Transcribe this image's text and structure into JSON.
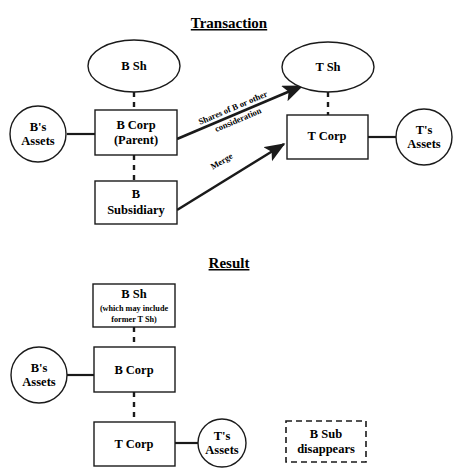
{
  "figure": {
    "background_color": "#ffffff",
    "stroke_color": "#1a1a1a"
  },
  "sections": [
    {
      "id": "transaction",
      "heading": "Transaction"
    },
    {
      "id": "result",
      "heading": "Result"
    }
  ],
  "transaction": {
    "heading": "Transaction",
    "nodes": {
      "b_shareholders": {
        "label": "B Sh",
        "shape": "ellipse"
      },
      "t_shareholders": {
        "label": "T Sh",
        "shape": "ellipse"
      },
      "b_corp_line1": "B Corp",
      "b_corp_line2": "(Parent)",
      "b_subsidiary_line1": "B",
      "b_subsidiary_line2": "Subsidiary",
      "t_corp": {
        "label": "T Corp",
        "shape": "rect"
      },
      "b_assets_line1": "B's",
      "b_assets_line2": "Assets",
      "t_assets_line1": "T's",
      "t_assets_line2": "Assets"
    },
    "edges": {
      "shares_line1": "Shares of B or other",
      "shares_line2": "consideration",
      "merge": "Merge"
    }
  },
  "result": {
    "heading": "Result",
    "nodes": {
      "b_shareholders_line1": "B Sh",
      "b_shareholders_line2": "(which may include",
      "b_shareholders_line3": "former T Sh)",
      "b_corp": {
        "label": "B Corp",
        "shape": "rect"
      },
      "t_corp": {
        "label": "T Corp",
        "shape": "rect"
      },
      "b_assets_line1": "B's",
      "b_assets_line2": "Assets",
      "t_assets_line1": "T's",
      "t_assets_line2": "Assets",
      "b_sub_line1": "B Sub",
      "b_sub_line2": "disappears"
    }
  }
}
